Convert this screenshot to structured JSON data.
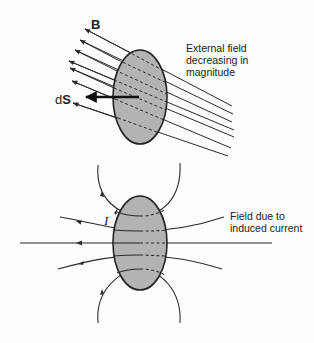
{
  "top_figure": {
    "vector_label": "B",
    "area_label_prefix": "d",
    "area_label_vector": "S",
    "annotation": "External field\ndecreasing in\nmagnitude"
  },
  "bottom_figure": {
    "current_label": "I",
    "annotation": "Field due to\ninduced current"
  },
  "colors": {
    "loop_fill": "#b3b3b3",
    "stroke": "#2a2a2a",
    "background": "#fdfdfd"
  }
}
